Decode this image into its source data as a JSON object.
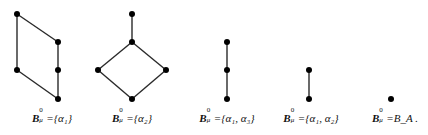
{
  "figure": {
    "stroke_color": "#2a2a2a",
    "node_color": "#000000",
    "node_radius": 3,
    "diagrams": [
      {
        "id": "diagram-1",
        "nodes": [
          {
            "x": 17,
            "y": 14
          },
          {
            "x": 58,
            "y": 42
          },
          {
            "x": 17,
            "y": 70
          },
          {
            "x": 58,
            "y": 70
          },
          {
            "x": 58,
            "y": 99
          }
        ],
        "edges": [
          [
            0,
            1
          ],
          [
            0,
            2
          ],
          [
            1,
            3
          ],
          [
            3,
            4
          ],
          [
            2,
            4
          ]
        ],
        "label": {
          "x": 52,
          "base": "B",
          "sup": "0",
          "sub": "μ",
          "rest": "={α₁}"
        }
      },
      {
        "id": "diagram-2",
        "nodes": [
          {
            "x": 132,
            "y": 14
          },
          {
            "x": 132,
            "y": 42
          },
          {
            "x": 98,
            "y": 70
          },
          {
            "x": 166,
            "y": 70
          },
          {
            "x": 132,
            "y": 99
          }
        ],
        "edges": [
          [
            0,
            1
          ],
          [
            1,
            2
          ],
          [
            1,
            3
          ],
          [
            2,
            4
          ],
          [
            3,
            4
          ]
        ],
        "label": {
          "x": 132,
          "base": "B",
          "sup": "0",
          "sub": "μ",
          "rest": "={α₂}"
        }
      },
      {
        "id": "diagram-3",
        "nodes": [
          {
            "x": 227,
            "y": 42
          },
          {
            "x": 227,
            "y": 70
          },
          {
            "x": 227,
            "y": 99
          }
        ],
        "edges": [
          [
            0,
            1
          ],
          [
            1,
            2
          ]
        ],
        "label": {
          "x": 227,
          "base": "B",
          "sup": "0",
          "sub": "μ",
          "rest": "={α₁, α₃}"
        }
      },
      {
        "id": "diagram-4",
        "nodes": [
          {
            "x": 309,
            "y": 70
          },
          {
            "x": 309,
            "y": 99
          }
        ],
        "edges": [
          [
            0,
            1
          ]
        ],
        "label": {
          "x": 309,
          "base": "B",
          "sup": "0",
          "sub": "μ",
          "rest": "={α₁, α₂}"
        }
      },
      {
        "id": "diagram-5",
        "nodes": [
          {
            "x": 391,
            "y": 99
          }
        ],
        "edges": [],
        "label": {
          "x": 393,
          "base": "B",
          "sup": "0",
          "sub": "μ",
          "rest": "=B_A ."
        }
      }
    ]
  },
  "labels": [
    {
      "base": "B",
      "sup": "0",
      "sub": "μ",
      "rest": "={α₁}"
    },
    {
      "base": "B",
      "sup": "0",
      "sub": "μ",
      "rest": "={α₂}"
    },
    {
      "base": "B",
      "sup": "0",
      "sub": "μ",
      "rest": "={α₁, α₃}"
    },
    {
      "base": "B",
      "sup": "0",
      "sub": "μ",
      "rest": "={α₁, α₂}"
    },
    {
      "base": "B",
      "sup": "0",
      "sub": "μ",
      "rest": "=B_A ."
    }
  ]
}
